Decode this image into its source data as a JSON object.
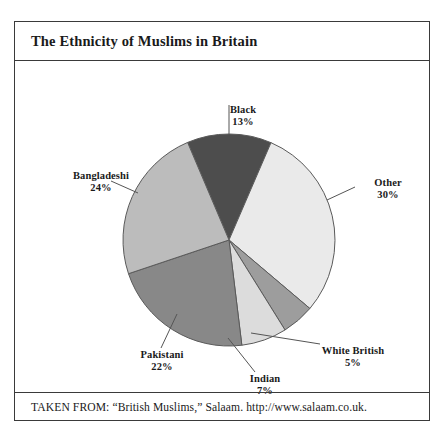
{
  "figure": {
    "title": "The Ethnicity of Muslims in Britain",
    "source": "TAKEN FROM: “British Muslims,” Salaam. http://www.salaam.co.uk."
  },
  "chart_data": {
    "type": "pie",
    "title": "The Ethnicity of Muslims in Britain",
    "xlabel": "",
    "ylabel": "",
    "legend": "none",
    "labels_position": "outside-with-leader-lines",
    "start_angle_deg": -23,
    "direction": "clockwise",
    "units": "percent",
    "categories": [
      "Black",
      "Other",
      "White British",
      "Indian",
      "Pakistani",
      "Bangladeshi"
    ],
    "values": [
      13,
      30,
      5,
      7,
      22,
      24
    ],
    "slices": [
      {
        "label": "Black",
        "value": 13,
        "pct": "13%",
        "color": "#4d4d4d"
      },
      {
        "label": "Other",
        "value": 30,
        "pct": "30%",
        "color": "#eaeaea"
      },
      {
        "label": "White British",
        "value": 5,
        "pct": "5%",
        "color": "#9d9d9d"
      },
      {
        "label": "Indian",
        "value": 7,
        "pct": "7%",
        "color": "#dcdcdc"
      },
      {
        "label": "Pakistani",
        "value": 22,
        "pct": "22%",
        "color": "#888888"
      },
      {
        "label": "Bangladeshi",
        "value": 24,
        "pct": "24%",
        "color": "#bcbcbc"
      }
    ]
  },
  "labels": {
    "black": {
      "name": "Black",
      "pct": "13%"
    },
    "other": {
      "name": "Other",
      "pct": "30%"
    },
    "white_british": {
      "name": "White British",
      "pct": "5%"
    },
    "indian": {
      "name": "Indian",
      "pct": "7%"
    },
    "pakistani": {
      "name": "Pakistani",
      "pct": "22%"
    },
    "bangladeshi": {
      "name": "Bangladeshi",
      "pct": "24%"
    }
  },
  "colors": {
    "frame": "#3a3a3a",
    "outline": "#5a5a5a",
    "leader": "#555555",
    "background": "#ffffff",
    "text": "#1a1a1a"
  }
}
